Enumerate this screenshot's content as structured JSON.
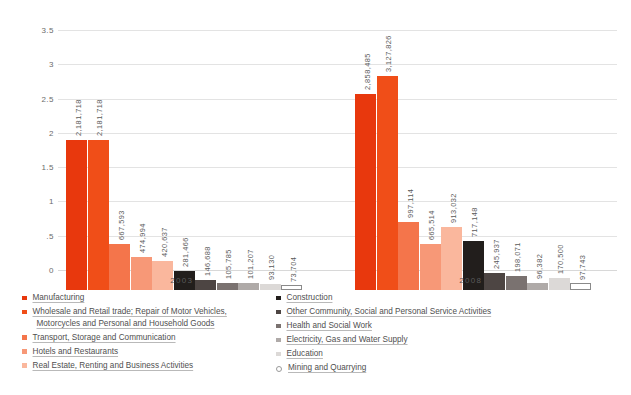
{
  "chart_data": {
    "type": "bar",
    "title": "",
    "xlabel": "",
    "ylabel": "in Millions",
    "ylim": [
      0,
      3.5
    ],
    "yticks": [
      "0",
      ".5",
      "1",
      "1.5",
      "2",
      "2.5",
      "3",
      "3.5"
    ],
    "grid": true,
    "legend_position": "bottom",
    "categories": [
      "2003",
      "2008"
    ],
    "series": [
      {
        "name": "Manufacturing",
        "color": "#E8380D",
        "values": [
          2181718,
          2858485
        ],
        "labels": [
          "2,181,718",
          "2,858,485"
        ]
      },
      {
        "name": "Wholesale and Retail trade; Repair of Motor Vehicles, Motorcycles and Personal and Household Goods",
        "color": "#F04E18",
        "values": [
          2181718,
          3127826
        ],
        "labels": [
          "2,181,718",
          "3,127,826"
        ]
      },
      {
        "name": "Transport, Storage and Communication",
        "color": "#F4754B",
        "values": [
          667593,
          997114
        ],
        "labels": [
          "667,593",
          "997,114"
        ]
      },
      {
        "name": "Hotels and Restaurants",
        "color": "#F79877",
        "values": [
          474994,
          665514
        ],
        "labels": [
          "474,994",
          "665,514"
        ]
      },
      {
        "name": "Real Estate, Renting and Business Activities",
        "color": "#FAB79D",
        "values": [
          420637,
          913032
        ],
        "labels": [
          "420,637",
          "913,032"
        ]
      },
      {
        "name": "Construction",
        "color": "#221E1C",
        "values": [
          281466,
          717148
        ],
        "labels": [
          "281,466",
          "717,148"
        ]
      },
      {
        "name": "Other Community, Social and Personal Service Activities",
        "color": "#4D4543",
        "values": [
          146688,
          245937
        ],
        "labels": [
          "146,688",
          "245,937"
        ]
      },
      {
        "name": "Health and Social Work",
        "color": "#7A7270",
        "values": [
          105785,
          198071
        ],
        "labels": [
          "105,785",
          "198,071"
        ]
      },
      {
        "name": "Electricity, Gas and Water Supply",
        "color": "#AFAAA8",
        "values": [
          101207,
          96382
        ],
        "labels": [
          "101,207",
          "96,382"
        ]
      },
      {
        "name": "Education",
        "color": "#DCD9D7",
        "values": [
          93130,
          170500
        ],
        "labels": [
          "93,130",
          "170,500"
        ]
      },
      {
        "name": "Mining and Quarrying",
        "color": "#FFFFFF",
        "values": [
          73704,
          97743
        ],
        "labels": [
          "73,704",
          "97,743"
        ]
      }
    ]
  },
  "axis": {
    "y_title": "in Millions",
    "ticks": [
      {
        "label": "3.5"
      },
      {
        "label": "3"
      },
      {
        "label": "2.5"
      },
      {
        "label": "2"
      },
      {
        "label": "1.5"
      },
      {
        "label": "1"
      },
      {
        "label": ".5"
      },
      {
        "label": "0"
      }
    ],
    "x_labels": [
      "2003",
      "2008"
    ]
  },
  "legend": {
    "left": [
      {
        "label": "Manufacturing",
        "label2": "",
        "color": "#E8380D",
        "hollow": false
      },
      {
        "label": "Wholesale and Retail trade; Repair of Motor Vehicles,",
        "label2": "Motorcycles and Personal and Household Goods",
        "color": "#F04E18",
        "hollow": false
      },
      {
        "label": "Transport, Storage and Communication",
        "label2": "",
        "color": "#F4754B",
        "hollow": false
      },
      {
        "label": "Hotels and Restaurants",
        "label2": "",
        "color": "#F79877",
        "hollow": false
      },
      {
        "label": "Real Estate, Renting and Business Activities",
        "label2": "",
        "color": "#FAB79D",
        "hollow": false
      }
    ],
    "right": [
      {
        "label": "Construction",
        "label2": "",
        "color": "#221E1C",
        "hollow": false
      },
      {
        "label": "Other Community, Social and Personal Service Activities",
        "label2": "",
        "color": "#4D4543",
        "hollow": false
      },
      {
        "label": "Health and Social Work",
        "label2": "",
        "color": "#7A7270",
        "hollow": false
      },
      {
        "label": "Electricity, Gas and Water Supply",
        "label2": "",
        "color": "#AFAAA8",
        "hollow": false
      },
      {
        "label": "Education",
        "label2": "",
        "color": "#DCD9D7",
        "hollow": false
      },
      {
        "label": "Mining and Quarrying",
        "label2": "",
        "color": "#FFFFFF",
        "hollow": true
      }
    ]
  }
}
